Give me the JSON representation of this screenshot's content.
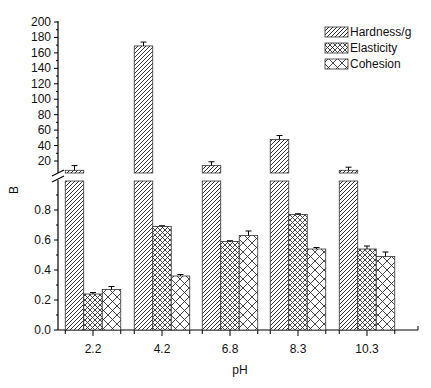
{
  "chart_data": {
    "type": "bar",
    "title": "",
    "xlabel": "pH",
    "ylabel": "B",
    "categories": [
      "2.2",
      "4.2",
      "6.8",
      "8.3",
      "10.3"
    ],
    "series": [
      {
        "name": "Hardness/g",
        "pattern": "diagonal-hatch",
        "values": [
          8,
          169,
          14,
          48,
          8
        ],
        "errors": [
          6,
          5,
          5,
          5,
          4
        ],
        "axis": "upper"
      },
      {
        "name": "Elasticity",
        "pattern": "fine-crosshatch",
        "values": [
          0.24,
          0.69,
          0.59,
          0.77,
          0.54
        ],
        "errors": [
          0.01,
          0.005,
          0.005,
          0.005,
          0.02
        ],
        "axis": "lower"
      },
      {
        "name": "Cohesion",
        "pattern": "coarse-crosshatch",
        "values": [
          0.27,
          0.36,
          0.63,
          0.54,
          0.49
        ],
        "errors": [
          0.02,
          0.01,
          0.03,
          0.01,
          0.03
        ],
        "axis": "lower"
      }
    ],
    "broken_axis": {
      "lower": {
        "range": [
          0,
          1.0
        ],
        "ticks": [
          "0.0",
          "0.2",
          "0.4",
          "0.6",
          "0.8"
        ]
      },
      "upper": {
        "range": [
          4.5,
          200
        ],
        "ticks": [
          "20",
          "40",
          "60",
          "80",
          "100",
          "120",
          "140",
          "160",
          "180",
          "200"
        ]
      }
    },
    "legend_position": "upper-right",
    "grid": false
  },
  "legend": {
    "items": [
      "Hardness/g",
      "Elasticity",
      "Cohesion"
    ]
  },
  "axes": {
    "x_title": "pH",
    "y_title": "B"
  }
}
